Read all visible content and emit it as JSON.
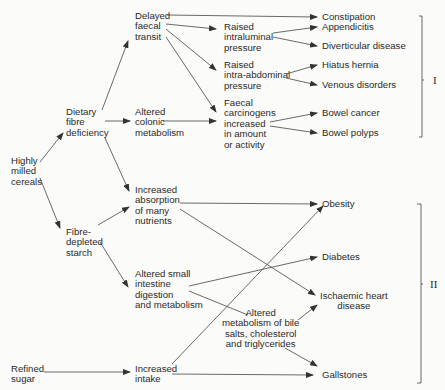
{
  "diagram": {
    "nodes": {
      "highly_milled": "Highly\nmilled\ncereals",
      "dietary_fibre": "Dietary\nfibre\ndeficiency",
      "fibre_depleted": "Fibre-\ndepleted\nstarch",
      "refined_sugar": "Refined\nsugar",
      "delayed_transit": "Delayed\nfaecal\ntransit",
      "altered_colonic": "Altered\ncolonic\nmetabolism",
      "increased_absorption": "Increased\nabsorption\nof many\nnutrients",
      "altered_small": "Altered small\nintestine\ndigestion\nand metabolism",
      "increased_intake": "Increased\nintake",
      "raised_intraluminal": "Raised\nintraluminal\npressure",
      "raised_intraabdominal": "Raised\nintra-abdominal\npressure",
      "faecal_carcinogens": "Faecal\ncarcinogens\nincreased\nin amount\nor activity",
      "altered_bile": "Altered\nmetabolism of bile\nsalts, cholesterol\nand triglycerides",
      "constipation": "Constipation",
      "appendicitis": "Appendicitis",
      "diverticular": "Diverticular disease",
      "hiatus_hernia": "Hiatus hernia",
      "venous": "Venous disorders",
      "bowel_cancer": "Bowel cancer",
      "bowel_polyps": "Bowel polyps",
      "obesity": "Obesity",
      "diabetes": "Diabetes",
      "ischaemic": "Ischaemic heart\ndisease",
      "gallstones": "Gallstones"
    },
    "groups": {
      "group_1": "I",
      "group_2": "II"
    },
    "colors": {
      "line": "#3a3a3a",
      "text": "#2a2a2a",
      "background": "#fbfbf9"
    }
  }
}
